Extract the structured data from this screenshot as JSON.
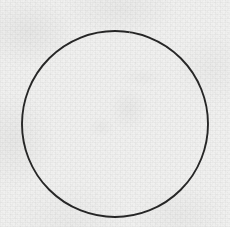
{
  "image": {
    "title": "Hand-drawn circle outline on paper",
    "medium_label": "pencil / ink line drawing on textured paper",
    "width": 230,
    "height": 227,
    "background_color": "#f1f1f0",
    "paper_tone_light": "#fbfbfa",
    "paper_tone_shadow": "#e3e3e1",
    "stroke_color": "#272727",
    "alt_text": "A single thin dark circle drawn on a lightly textured off-white paper background."
  },
  "shapes": [
    {
      "name": "circle-outline",
      "type": "circle",
      "center_x": 115,
      "center_y": 124,
      "radius": 93,
      "stroke_color": "#272727",
      "stroke_width": 1.9,
      "fill": "none"
    }
  ],
  "texture": {
    "grain_label": "fine paper grain",
    "blotch_label": "uneven paper tone",
    "smudge_label": "faint interior smudging"
  }
}
